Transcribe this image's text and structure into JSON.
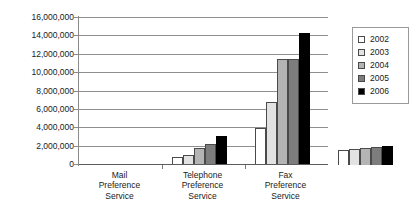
{
  "chart_data": {
    "type": "bar",
    "title": "",
    "subtitle": "",
    "xlabel": "",
    "ylabel": "",
    "ylim": [
      0,
      16000000
    ],
    "grid": true,
    "legend_position": "right",
    "categories": [
      "Mail Preference Service",
      "Telephone Preference Service",
      "Fax Preference Service"
    ],
    "category_lines": [
      [
        "Mail",
        "Preference",
        "Service"
      ],
      [
        "Telephone",
        "Preference",
        "Service"
      ],
      [
        "Fax",
        "Preference",
        "Service"
      ]
    ],
    "y_ticks": [
      0,
      2000000,
      4000000,
      6000000,
      8000000,
      10000000,
      12000000,
      14000000,
      16000000
    ],
    "y_tick_labels": [
      "0",
      "2,000,000",
      "4,000,000",
      "6,000,000",
      "8,000,000",
      "10,000,000",
      "12,000,000",
      "14,000,000",
      "16,000,000"
    ],
    "series": [
      {
        "name": "2002",
        "color": "#ffffff",
        "values": [
          850000,
          4000000,
          1600000
        ]
      },
      {
        "name": "2003",
        "color": "#e2e2e2",
        "values": [
          1100000,
          6900000,
          1700000
        ]
      },
      {
        "name": "2004",
        "color": "#b4b4b4",
        "values": [
          1800000,
          11500000,
          1900000
        ]
      },
      {
        "name": "2005",
        "color": "#7d7d7d",
        "values": [
          2250000,
          11500000,
          1950000
        ]
      },
      {
        "name": "2006",
        "color": "#000000",
        "values": [
          3200000,
          14400000,
          2050000
        ]
      }
    ]
  },
  "legend": {
    "items": [
      {
        "label": "2002"
      },
      {
        "label": "2003"
      },
      {
        "label": "2004"
      },
      {
        "label": "2005"
      },
      {
        "label": "2006"
      }
    ]
  }
}
